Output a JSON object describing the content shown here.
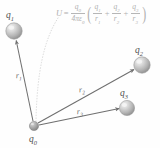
{
  "figure": {
    "background_color": "#fefefe",
    "ink_color": "#6b6b6b",
    "formula_color": "#b0b0b0"
  },
  "formula": {
    "lhs": "U",
    "equals": "=",
    "prefactor": {
      "numerator": "q",
      "numerator_sub": "0",
      "denominator": "4πε",
      "denominator_sub": "0"
    },
    "open_paren": "(",
    "close_paren": ")",
    "terms": [
      {
        "numerator": "q",
        "numerator_sub": "1",
        "denominator": "r",
        "denominator_sub": "1"
      },
      {
        "numerator": "q",
        "numerator_sub": "2",
        "denominator": "r",
        "denominator_sub": "2"
      },
      {
        "numerator": "q",
        "numerator_sub": "3",
        "denominator": "r",
        "denominator_sub": "3"
      }
    ],
    "plus": "+",
    "plain_text": "U = q0 / (4πε0) ( q1/r1 + q2/r2 + q3/r3 )"
  },
  "charges": [
    {
      "id": "q0",
      "label": "q",
      "sub": "0",
      "cx": 34,
      "cy": 126,
      "r": 4.6,
      "label_x": 29,
      "label_y": 136
    },
    {
      "id": "q1",
      "label": "q",
      "sub": "1",
      "cx": 14,
      "cy": 31,
      "r": 8.2,
      "label_x": 6,
      "label_y": 11
    },
    {
      "id": "q2",
      "label": "q",
      "sub": "2",
      "cx": 142,
      "cy": 65,
      "r": 8.2,
      "label_x": 135,
      "label_y": 46
    },
    {
      "id": "q3",
      "label": "q",
      "sub": "3",
      "cx": 127,
      "cy": 108,
      "r": 7.6,
      "label_x": 120,
      "label_y": 89
    }
  ],
  "vectors": [
    {
      "id": "r1",
      "label": "r",
      "sub": "1",
      "from": "q0",
      "to": "q1",
      "x1": 33,
      "y1": 121,
      "x2": 16,
      "y2": 40,
      "label_x": 16,
      "label_y": 73
    },
    {
      "id": "r2",
      "label": "r",
      "sub": "2",
      "from": "q0",
      "to": "q2",
      "x1": 38,
      "y1": 123,
      "x2": 134,
      "y2": 70,
      "label_x": 79,
      "label_y": 89
    },
    {
      "id": "r3",
      "label": "r",
      "sub": "3",
      "from": "q0",
      "to": "q3",
      "x1": 39,
      "y1": 125,
      "x2": 119,
      "y2": 108,
      "label_x": 77,
      "label_y": 110
    }
  ],
  "leader_line": {
    "name": "formula-leader-line",
    "style": "dotted-curve",
    "from_x": 58,
    "from_y": 18,
    "to_x": 36,
    "to_y": 121,
    "color": "#d8d8d8"
  }
}
